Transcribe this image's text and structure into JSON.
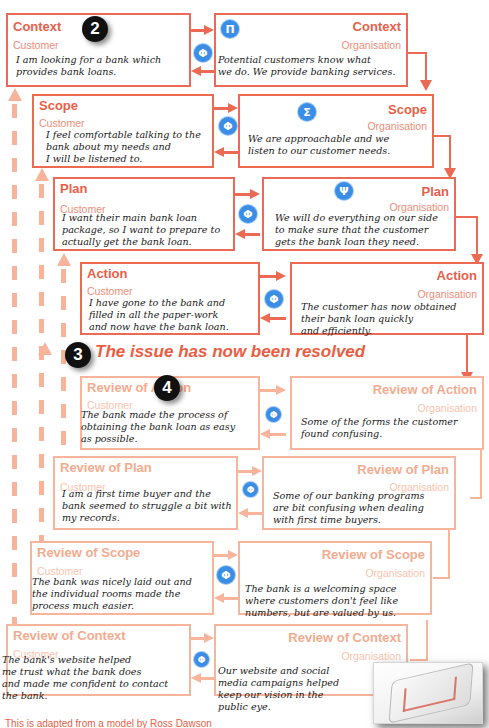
{
  "colors": {
    "primary": "#ec6a54",
    "light": "#f8b59b",
    "badge": "#3b8ee6",
    "marker": "#111111"
  },
  "markers": {
    "two": "2",
    "three": "3",
    "four": "4"
  },
  "badges": {
    "phi": "Φ",
    "pi": "Π",
    "sigma": "Σ",
    "psi": "Ψ"
  },
  "resolved_banner": "The issue has now been resolved",
  "footnote": "This is adapted from a model by Ross Dawson",
  "rows": [
    {
      "customer": {
        "title": "Context",
        "role": "Customer",
        "text": "I am looking for a bank which\nprovides bank loans."
      },
      "organisation": {
        "title": "Context",
        "role": "Organisation",
        "text": "Potential customers know what\nwe do. We provide banking services."
      }
    },
    {
      "customer": {
        "title": "Scope",
        "role": "Customer",
        "text": "I feel comfortable talking to the\nbank about my needs and\nI will be listened to."
      },
      "organisation": {
        "title": "Scope",
        "role": "Organisation",
        "text": "We are approachable and we\nlisten to our customer needs."
      }
    },
    {
      "customer": {
        "title": "Plan",
        "role": "Customer",
        "text": "I want their main bank loan\npackage, so I want to prepare to\nactually get the bank loan."
      },
      "organisation": {
        "title": "Plan",
        "role": "Organisation",
        "text": "We will do everything on our side\nto make sure that the customer\ngets the bank loan they need."
      }
    },
    {
      "customer": {
        "title": "Action",
        "role": "Customer",
        "text": "I have gone to the bank and\nfilled in all the paper-work\nand now have the bank loan."
      },
      "organisation": {
        "title": "Action",
        "role": "Organisation",
        "text": "The customer has now obtained\ntheir bank loan quickly\nand efficiently."
      }
    },
    {
      "customer": {
        "title": "Review of Action",
        "role": "Customer",
        "text": "The bank made the process of\nobtaining the bank loan as easy\nas possible."
      },
      "organisation": {
        "title": "Review of Action",
        "role": "Organisation",
        "text": "Some of the forms the customer\nfound confusing."
      }
    },
    {
      "customer": {
        "title": "Review of Plan",
        "role": "Customer",
        "text": "I am a first time buyer and the\nbank seemed to struggle a bit with\nmy records."
      },
      "organisation": {
        "title": "Review of Plan",
        "role": "Organisation",
        "text": "Some of our banking programs\nare bit confusing when dealing\nwith first time buyers."
      }
    },
    {
      "customer": {
        "title": "Review of Scope",
        "role": "Customer",
        "text": "The bank was nicely laid out and\nthe individual rooms made the\nprocess much easier."
      },
      "organisation": {
        "title": "Review of Scope",
        "role": "Organisation",
        "text": "The bank is a welcoming space\nwhere customers don't feel like\nnumbers, but are valued by us."
      }
    },
    {
      "customer": {
        "title": "Review of Context",
        "role": "Customer",
        "text": "The bank's website helped\nme trust what the bank does\nand made me confident to contact\nthe bank."
      },
      "organisation": {
        "title": "Review of Context",
        "role": "Organisation",
        "text": "Our website and social\nmedia campaigns helped\nkeep our vision in the\npublic eye."
      }
    }
  ]
}
